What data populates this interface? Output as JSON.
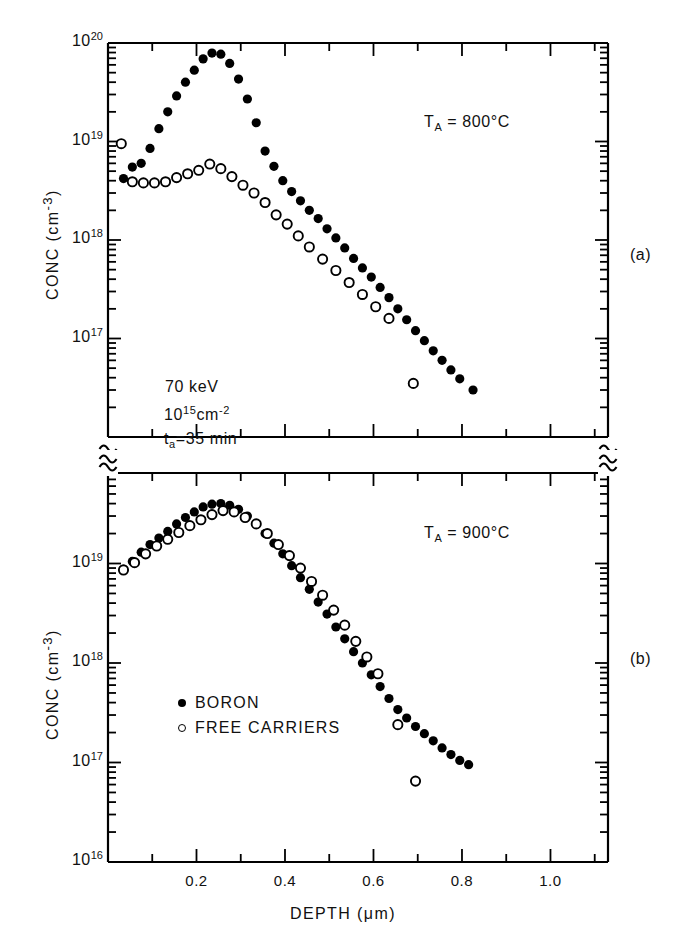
{
  "figure": {
    "xlabel": "DEPTH (μm)",
    "ylabel_a": "CONC (cm",
    "ylabel_a_sup": "-3",
    "ylabel_a_tail": ")",
    "ylabel_b": "CONC (cm",
    "ylabel_b_sup": "-3",
    "ylabel_b_tail": ")",
    "panel_a_tag": "(a)",
    "panel_b_tag": "(b)",
    "axis_break_symbol": "≈"
  },
  "annotations": {
    "ta_800": {
      "base": "T",
      "sub": "A",
      "value": " = 800°C"
    },
    "ta_900": {
      "base": "T",
      "sub": "A",
      "value": " = 900°C"
    },
    "energy": "70 keV",
    "dose_mantissa": "10",
    "dose_exp": "15",
    "dose_unit": "cm",
    "dose_unit_exp": "-2",
    "time_base": "t",
    "time_sub": "a",
    "time_value": "=35 min"
  },
  "legend": {
    "items": [
      {
        "marker": "filled-circle",
        "label": "BORON"
      },
      {
        "marker": "open-circle",
        "label": "FREE CARRIERS"
      }
    ]
  },
  "axes": {
    "x_ticks": [
      {
        "value": 0.2,
        "label": "0.2"
      },
      {
        "value": 0.4,
        "label": "0.4"
      },
      {
        "value": 0.6,
        "label": "0.6"
      },
      {
        "value": 0.8,
        "label": "0.8"
      },
      {
        "value": 1.0,
        "label": "1.0"
      }
    ],
    "x_minor_ticks": [
      0.1,
      0.3,
      0.5,
      0.7,
      0.9,
      1.1
    ],
    "x_range": [
      0.0,
      1.13
    ],
    "panel_a_y_labels": [
      {
        "mantissa": "10",
        "exp": "20",
        "value": 1e+20
      },
      {
        "mantissa": "10",
        "exp": "19",
        "value": 1e+19
      },
      {
        "mantissa": "10",
        "exp": "18",
        "value": 1e+18
      },
      {
        "mantissa": "10",
        "exp": "17",
        "value": 1e+17
      }
    ],
    "panel_b_y_labels": [
      {
        "mantissa": "10",
        "exp": "19",
        "value": 1e+19
      },
      {
        "mantissa": "10",
        "exp": "18",
        "value": 1e+18
      },
      {
        "mantissa": "10",
        "exp": "17",
        "value": 1e+17
      },
      {
        "mantissa": "10",
        "exp": "16",
        "value": 1e+16
      }
    ],
    "panel_a_ylim": [
      2.2e+16,
      1e+20
    ],
    "panel_b_ylim": [
      1e+16,
      2e+20
    ]
  },
  "chart_data": {
    "type": "scatter",
    "title": "",
    "xlabel": "DEPTH (μm)",
    "ylabel": "CONC (cm-3)",
    "xlim": [
      0.0,
      1.13
    ],
    "xscale": "linear",
    "yscale": "log",
    "grid": false,
    "legend_position": "lower-left-panel-b",
    "panels": [
      {
        "tag": "(a)",
        "condition": "T_A = 800 °C",
        "ylim": [
          2.2e+16,
          1e+20
        ],
        "series": [
          {
            "name": "BORON",
            "marker": "filled-circle",
            "x": [
              0.035,
              0.055,
              0.075,
              0.095,
              0.115,
              0.135,
              0.155,
              0.175,
              0.195,
              0.215,
              0.235,
              0.255,
              0.275,
              0.295,
              0.315,
              0.335,
              0.355,
              0.375,
              0.395,
              0.415,
              0.435,
              0.455,
              0.475,
              0.495,
              0.515,
              0.535,
              0.555,
              0.575,
              0.595,
              0.615,
              0.635,
              0.655,
              0.675,
              0.695,
              0.715,
              0.735,
              0.755,
              0.775,
              0.795,
              0.825
            ],
            "y": [
              4.2e+18,
              5.5e+18,
              6e+18,
              8.5e+18,
              1.35e+19,
              2e+19,
              2.9e+19,
              4e+19,
              5.3e+19,
              6.9e+19,
              7.9e+19,
              7.7e+19,
              6.2e+19,
              4.3e+19,
              2.7e+19,
              1.55e+19,
              8e+18,
              5.6e+18,
              4e+18,
              3.1e+18,
              2.5e+18,
              2e+18,
              1.65e+18,
              1.3e+18,
              1.05e+18,
              8.3e+17,
              6.5e+17,
              5.2e+17,
              4.2e+17,
              3.3e+17,
              2.6e+17,
              2e+17,
              1.55e+17,
              1.2e+17,
              9.5e+16,
              7.5e+16,
              6e+16,
              4.8e+16,
              3.9e+16,
              3e+16
            ]
          },
          {
            "name": "FREE CARRIERS",
            "marker": "open-circle",
            "x": [
              0.03,
              0.055,
              0.08,
              0.105,
              0.13,
              0.155,
              0.18,
              0.205,
              0.23,
              0.255,
              0.28,
              0.305,
              0.33,
              0.355,
              0.38,
              0.405,
              0.43,
              0.455,
              0.485,
              0.515,
              0.545,
              0.575,
              0.605,
              0.635,
              0.69
            ],
            "y": [
              9.5e+18,
              3.9e+18,
              3.8e+18,
              3.8e+18,
              3.9e+18,
              4.3e+18,
              4.7e+18,
              5.1e+18,
              5.9e+18,
              5.3e+18,
              4.4e+18,
              3.6e+18,
              3e+18,
              2.4e+18,
              1.8e+18,
              1.45e+18,
              1.1e+18,
              8.5e+17,
              6.4e+17,
              4.9e+17,
              3.7e+17,
              2.8e+17,
              2.1e+17,
              1.6e+17,
              3.5e+16
            ]
          }
        ]
      },
      {
        "tag": "(b)",
        "condition": "T_A = 900 °C",
        "ylim": [
          1e+16,
          2e+20
        ],
        "series": [
          {
            "name": "BORON",
            "marker": "filled-circle",
            "x": [
              0.035,
              0.055,
              0.075,
              0.095,
              0.115,
              0.135,
              0.155,
              0.175,
              0.195,
              0.215,
              0.235,
              0.255,
              0.275,
              0.295,
              0.315,
              0.335,
              0.355,
              0.375,
              0.395,
              0.415,
              0.435,
              0.455,
              0.475,
              0.495,
              0.515,
              0.535,
              0.555,
              0.575,
              0.595,
              0.615,
              0.635,
              0.655,
              0.675,
              0.695,
              0.715,
              0.735,
              0.755,
              0.775,
              0.795,
              0.815
            ],
            "y": [
              8.8e+18,
              1.05e+19,
              1.3e+19,
              1.55e+19,
              1.8e+19,
              2.1e+19,
              2.5e+19,
              2.9e+19,
              3.3e+19,
              3.7e+19,
              3.95e+19,
              4e+19,
              3.85e+19,
              3.5e+19,
              3e+19,
              2.5e+19,
              2e+19,
              1.6e+19,
              1.25e+19,
              9.5e+18,
              7.2e+18,
              5.5e+18,
              4.1e+18,
              3.1e+18,
              2.3e+18,
              1.75e+18,
              1.3e+18,
              1e+18,
              7.6e+17,
              5.8e+17,
              4.4e+17,
              3.4e+17,
              2.8e+17,
              2.3e+17,
              1.95e+17,
              1.65e+17,
              1.4e+17,
              1.2e+17,
              1.05e+17,
              9.5e+16
            ]
          },
          {
            "name": "FREE CARRIERS",
            "marker": "open-circle",
            "x": [
              0.035,
              0.06,
              0.085,
              0.11,
              0.135,
              0.16,
              0.185,
              0.21,
              0.235,
              0.26,
              0.285,
              0.31,
              0.335,
              0.36,
              0.385,
              0.41,
              0.435,
              0.46,
              0.485,
              0.51,
              0.535,
              0.56,
              0.585,
              0.61,
              0.655,
              0.695
            ],
            "y": [
              8.6e+18,
              1.02e+19,
              1.25e+19,
              1.5e+19,
              1.75e+19,
              2.05e+19,
              2.4e+19,
              2.75e+19,
              3.1e+19,
              3.4e+19,
              3.3e+19,
              2.9e+19,
              2.5e+19,
              2e+19,
              1.55e+19,
              1.2e+19,
              9e+18,
              6.6e+18,
              4.8e+18,
              3.4e+18,
              2.4e+18,
              1.65e+18,
              1.15e+18,
              7.8e+17,
              2.4e+17,
              6.5e+16
            ]
          }
        ]
      }
    ]
  }
}
